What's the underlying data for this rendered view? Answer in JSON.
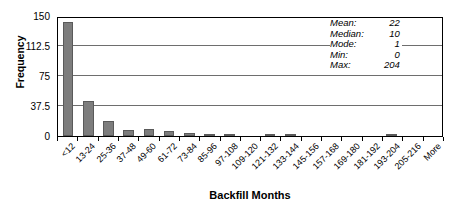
{
  "chart_data": {
    "type": "bar",
    "title": "",
    "xlabel": "Backfill Months",
    "ylabel": "Frequency",
    "ylim": [
      0,
      150
    ],
    "yticks": [
      0,
      37.5,
      75,
      112.5,
      150
    ],
    "ytick_labels": [
      "0",
      "37.5",
      "75",
      "112.5",
      "150"
    ],
    "grid": true,
    "grid_axis": "y",
    "legend": false,
    "bar_color": "#7d7d7d",
    "categories": [
      "<12",
      "13-24",
      "25-36",
      "37-48",
      "49-60",
      "61-72",
      "73-84",
      "85-96",
      "97-108",
      "109-120",
      "121-132",
      "133-144",
      "145-156",
      "157-168",
      "169-180",
      "181-192",
      "193-204",
      "205-216",
      "More"
    ],
    "values": [
      142,
      44,
      19,
      8,
      9,
      6,
      4,
      2,
      1,
      0,
      1,
      2,
      0,
      0,
      0,
      0,
      2,
      0,
      0
    ],
    "annotations": {
      "Mean": 22,
      "Median": 10,
      "Mode": 1,
      "Min": 0,
      "Max": 204
    }
  },
  "stats": {
    "rows": [
      {
        "label": "Mean:",
        "value": "22"
      },
      {
        "label": "Median:",
        "value": "10"
      },
      {
        "label": "Mode:",
        "value": "1"
      },
      {
        "label": "Min:",
        "value": "0"
      },
      {
        "label": "Max:",
        "value": "204"
      }
    ]
  }
}
